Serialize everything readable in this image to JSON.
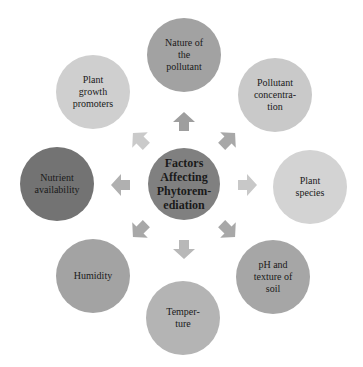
{
  "diagram": {
    "center": {
      "label": "Factors\nAffecting\nPhytorem-\nediation",
      "color": "#808080"
    },
    "factors": [
      {
        "label": "Nature of\nthe\npollutant",
        "color": "#a2a2a2"
      },
      {
        "label": "Pollutant\nconcentra-\ntion",
        "color": "#c9c9c9"
      },
      {
        "label": "Plant\nspecies",
        "color": "#d3d3d3"
      },
      {
        "label": "pH and\ntexture of\nsoil",
        "color": "#a6a6a6"
      },
      {
        "label": "Temper-\nture",
        "color": "#b4b4b4"
      },
      {
        "label": "Humidity",
        "color": "#a3a3a3"
      },
      {
        "label": "Nutrient\navailability",
        "color": "#737373"
      },
      {
        "label": "Plant\ngrowth\npromoters",
        "color": "#cfcfcf"
      }
    ],
    "arrow_colors": [
      "#9e9e9e",
      "#a8a8a8",
      "#c8c8c8",
      "#a8a8a8",
      "#b8b8b8",
      "#a8a8a8",
      "#b0b0b0",
      "#cacaca"
    ]
  }
}
